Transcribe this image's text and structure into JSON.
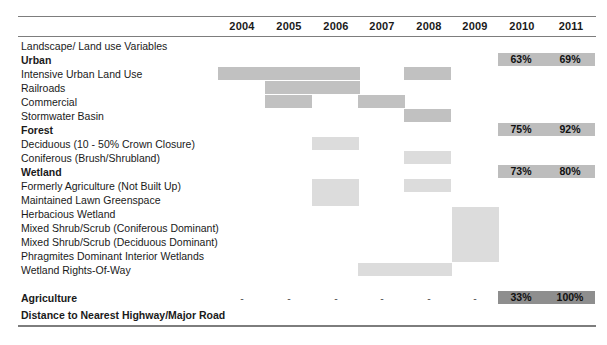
{
  "table": {
    "title_row": "Landscape/ Land use Variables",
    "columns": [
      {
        "label": "2004",
        "x": 219
      },
      {
        "label": "2005",
        "x": 266
      },
      {
        "label": "2006",
        "x": 313
      },
      {
        "label": "2007",
        "x": 359
      },
      {
        "label": "2008",
        "x": 406
      },
      {
        "label": "2009",
        "x": 452
      },
      {
        "label": "2010",
        "x": 499
      },
      {
        "label": "2011",
        "x": 548
      }
    ],
    "rows": [
      {
        "label": "Landscape/ Land use Variables",
        "bold": false,
        "y": 41,
        "bars": [],
        "pct": null,
        "dashes": false
      },
      {
        "label": "Urban",
        "bold": true,
        "y": 55,
        "bars": [],
        "pct": {
          "v2010": "63%",
          "v2011": "69%",
          "dark": false
        },
        "dashes": false
      },
      {
        "label": "Intensive Urban Land Use",
        "bold": false,
        "y": 69,
        "bars": [
          {
            "x": 218,
            "w": 142,
            "h": 13,
            "light": false
          },
          {
            "x": 404,
            "w": 47,
            "h": 13,
            "light": false
          }
        ],
        "pct": null,
        "dashes": false
      },
      {
        "label": "Railroads",
        "bold": false,
        "y": 83,
        "bars": [
          {
            "x": 265,
            "w": 95,
            "h": 13,
            "light": false
          }
        ],
        "pct": null,
        "dashes": false
      },
      {
        "label": "Commercial",
        "bold": false,
        "y": 97,
        "bars": [
          {
            "x": 265,
            "w": 47,
            "h": 13,
            "light": false
          },
          {
            "x": 358,
            "w": 47,
            "h": 13,
            "light": false
          }
        ],
        "pct": null,
        "dashes": false
      },
      {
        "label": "Stormwater Basin",
        "bold": false,
        "y": 111,
        "bars": [
          {
            "x": 404,
            "w": 47,
            "h": 13,
            "light": false
          }
        ],
        "pct": null,
        "dashes": false
      },
      {
        "label": "Forest",
        "bold": true,
        "y": 125,
        "bars": [],
        "pct": {
          "v2010": "75%",
          "v2011": "92%",
          "dark": false
        },
        "dashes": false
      },
      {
        "label": "Deciduous (10 - 50% Crown Closure)",
        "bold": false,
        "y": 139,
        "bars": [
          {
            "x": 312,
            "w": 47,
            "h": 13,
            "light": true
          }
        ],
        "pct": null,
        "dashes": false
      },
      {
        "label": "Coniferous (Brush/Shrubland)",
        "bold": false,
        "y": 153,
        "bars": [
          {
            "x": 404,
            "w": 47,
            "h": 13,
            "light": true
          }
        ],
        "pct": null,
        "dashes": false
      },
      {
        "label": "Wetland",
        "bold": true,
        "y": 167,
        "bars": [],
        "pct": {
          "v2010": "73%",
          "v2011": "80%",
          "dark": false
        },
        "dashes": false
      },
      {
        "label": "Formerly Agriculture (Not Built Up)",
        "bold": false,
        "y": 181,
        "bars": [
          {
            "x": 312,
            "w": 47,
            "h": 27,
            "light": true
          },
          {
            "x": 404,
            "w": 47,
            "h": 13,
            "light": true
          }
        ],
        "pct": null,
        "dashes": false
      },
      {
        "label": "Maintained Lawn Greenspace",
        "bold": false,
        "y": 195,
        "bars": [],
        "pct": null,
        "dashes": false
      },
      {
        "label": "Herbacious Wetland",
        "bold": false,
        "y": 209,
        "bars": [
          {
            "x": 452,
            "w": 47,
            "h": 55,
            "light": true
          }
        ],
        "pct": null,
        "dashes": false
      },
      {
        "label": "Mixed Shrub/Scrub (Coniferous Dominant)",
        "bold": false,
        "y": 223,
        "bars": [],
        "pct": null,
        "dashes": false
      },
      {
        "label": "Mixed Shrub/Scrub (Deciduous Dominant)",
        "bold": false,
        "y": 237,
        "bars": [],
        "pct": null,
        "dashes": false
      },
      {
        "label": "Phragmites Dominant Interior Wetlands",
        "bold": false,
        "y": 251,
        "bars": [],
        "pct": null,
        "dashes": false
      },
      {
        "label": "Wetland Rights-Of-Way",
        "bold": false,
        "y": 265,
        "bars": [
          {
            "x": 358,
            "w": 94,
            "h": 13,
            "light": true
          }
        ],
        "pct": null,
        "dashes": false
      },
      {
        "label": "Agriculture",
        "bold": true,
        "y": 293,
        "bars": [],
        "pct": {
          "v2010": "33%",
          "v2011": "100%",
          "dark": true
        },
        "dashes": true
      },
      {
        "label": "Distance to Nearest Highway/Major Road",
        "bold": true,
        "y": 310,
        "bars": [],
        "pct": null,
        "dashes": false
      }
    ],
    "dash_glyph": "-",
    "dash_columns": [
      "2004",
      "2005",
      "2006",
      "2007",
      "2008",
      "2009"
    ]
  },
  "colors": {
    "bar_mid": "#c1c1c1",
    "bar_light": "#dcdcdc",
    "pct_bar": "#bdbdbd",
    "pct_bar_dark": "#8e8e8e",
    "rule": "#7d7d7d",
    "text": "#1a1a1a"
  }
}
